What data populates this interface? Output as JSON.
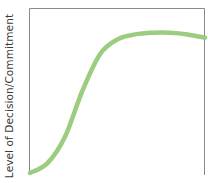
{
  "chart_data": {
    "type": "line",
    "title": "",
    "xlabel": "",
    "ylabel": "Level of Decision/Commitment",
    "grid": false,
    "legend": null,
    "series": [
      {
        "name": "Decision/Commitment",
        "color": "#9ccc7f",
        "x": [
          0,
          0.1,
          0.2,
          0.3,
          0.4,
          0.5,
          0.6,
          0.7,
          0.8,
          0.9,
          1.0
        ],
        "values": [
          0.0,
          0.06,
          0.22,
          0.5,
          0.72,
          0.81,
          0.84,
          0.85,
          0.85,
          0.84,
          0.82
        ]
      }
    ],
    "xlim": [
      0,
      1
    ],
    "ylim": [
      0,
      1
    ]
  },
  "colors": {
    "curve": "#9ccc7f",
    "axis": "#8a8a8a",
    "label": "#3a3a3a"
  }
}
